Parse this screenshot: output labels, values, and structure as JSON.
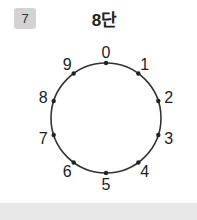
{
  "problem": {
    "number": "7",
    "title": "8단"
  },
  "dial": {
    "labels": [
      "0",
      "1",
      "2",
      "3",
      "4",
      "5",
      "6",
      "7",
      "8",
      "9"
    ],
    "center": [
      106,
      118
    ],
    "radius": 55,
    "line_color": "#333333"
  },
  "colors": {
    "badge_bg": "#d3d3d3",
    "footer_bg": "#e8e8e8"
  }
}
